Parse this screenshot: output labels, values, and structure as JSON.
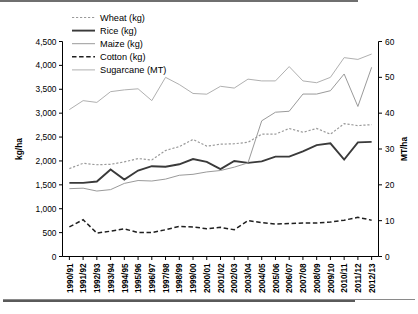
{
  "chart_data": {
    "type": "line",
    "title": "",
    "xlabel": "",
    "ylabel": "kg/ha",
    "y2label": "MT/ha",
    "ylim": [
      0,
      4500
    ],
    "y2lim": [
      0,
      60
    ],
    "yticks": [
      "0",
      "500",
      "1,000",
      "1,500",
      "2,000",
      "2,500",
      "3,000",
      "3,500",
      "4,000",
      "4,500"
    ],
    "ytick_values": [
      0,
      500,
      1000,
      1500,
      2000,
      2500,
      3000,
      3500,
      4000,
      4500
    ],
    "y2ticks": [
      "0",
      "10",
      "20",
      "30",
      "40",
      "50",
      "60"
    ],
    "y2tick_values": [
      0,
      10,
      20,
      30,
      40,
      50,
      60
    ],
    "grid": false,
    "legend_position": "top-left",
    "categories": [
      "1990/91",
      "1991/92",
      "1992/93",
      "1993/94",
      "1994/95",
      "1995/96",
      "1996/97",
      "1997/98",
      "1998/99",
      "1999/00",
      "2000/01",
      "2001/02",
      "2002/03",
      "2003/04",
      "2004/05",
      "2005/06",
      "2006/07",
      "2007/08",
      "2008/09",
      "2009/10",
      "2010/11",
      "2011/12",
      "2012/13"
    ],
    "series": [
      {
        "name": "Wheat (kg)",
        "unit": "kg/ha",
        "axis": "left",
        "style": "dotted",
        "color": "#9a9a9a",
        "values": [
          1840,
          1950,
          1920,
          1930,
          1980,
          2050,
          2020,
          2220,
          2300,
          2450,
          2310,
          2350,
          2360,
          2390,
          2560,
          2560,
          2680,
          2600,
          2680,
          2560,
          2780,
          2740,
          2760
        ]
      },
      {
        "name": "Rice (kg)",
        "unit": "kg/ha",
        "axis": "left",
        "style": "solid-thick",
        "color": "#3a3a3a",
        "values": [
          1540,
          1540,
          1570,
          1820,
          1610,
          1800,
          1890,
          1880,
          1930,
          2040,
          1980,
          1830,
          2000,
          1960,
          1990,
          2090,
          2090,
          2200,
          2330,
          2370,
          2030,
          2390,
          2400
        ]
      },
      {
        "name": "Maize (kg)",
        "unit": "kg/ha",
        "axis": "left",
        "style": "solid-thin",
        "color": "#9a9a9a",
        "values": [
          1420,
          1430,
          1370,
          1400,
          1530,
          1590,
          1580,
          1620,
          1700,
          1720,
          1770,
          1800,
          1870,
          1960,
          2840,
          3020,
          3040,
          3400,
          3400,
          3470,
          3820,
          3140,
          3960
        ]
      },
      {
        "name": "Cotton (kg)",
        "unit": "kg/ha",
        "axis": "left",
        "style": "dashed",
        "color": "#1f1f1f",
        "values": [
          620,
          770,
          490,
          530,
          580,
          500,
          500,
          560,
          630,
          620,
          580,
          610,
          560,
          750,
          710,
          680,
          690,
          700,
          700,
          720,
          760,
          820,
          760
        ]
      },
      {
        "name": "Sugarcane (MT)",
        "unit": "MT/ha",
        "axis": "right",
        "style": "solid-thin",
        "color": "#b0b0b0",
        "values": [
          41.0,
          43.5,
          43.0,
          46.0,
          46.5,
          46.8,
          43.5,
          50.0,
          48.0,
          45.5,
          45.3,
          47.5,
          47.0,
          49.5,
          49.0,
          49.0,
          53.0,
          49.0,
          48.5,
          50.0,
          55.5,
          55.0,
          56.5
        ]
      }
    ]
  }
}
